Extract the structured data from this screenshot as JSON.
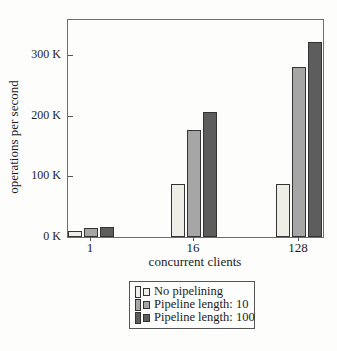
{
  "chart_data": {
    "type": "bar",
    "title": "",
    "xlabel": "concurrent clients",
    "ylabel": "operations per second",
    "categories": [
      "1",
      "16",
      "128"
    ],
    "series": [
      {
        "name": "No pipelining",
        "color": "#efeee6",
        "values": [
          10000,
          87000,
          87000
        ]
      },
      {
        "name": "Pipeline length: 10",
        "color": "#a6a6a6",
        "values": [
          15000,
          177000,
          280000
        ]
      },
      {
        "name": "Pipeline length: 100",
        "color": "#5d5d5d",
        "values": [
          17000,
          206000,
          322000
        ]
      }
    ],
    "yticks": [
      {
        "value": 0,
        "label": "0 K"
      },
      {
        "value": 100000,
        "label": "100 K"
      },
      {
        "value": 200000,
        "label": "200 K"
      },
      {
        "value": 300000,
        "label": "300 K"
      }
    ],
    "ylim": [
      0,
      358000
    ],
    "grid": false,
    "legend_position": "below",
    "bar_outline": "#333333",
    "frame_color": "#6e6e6e"
  }
}
